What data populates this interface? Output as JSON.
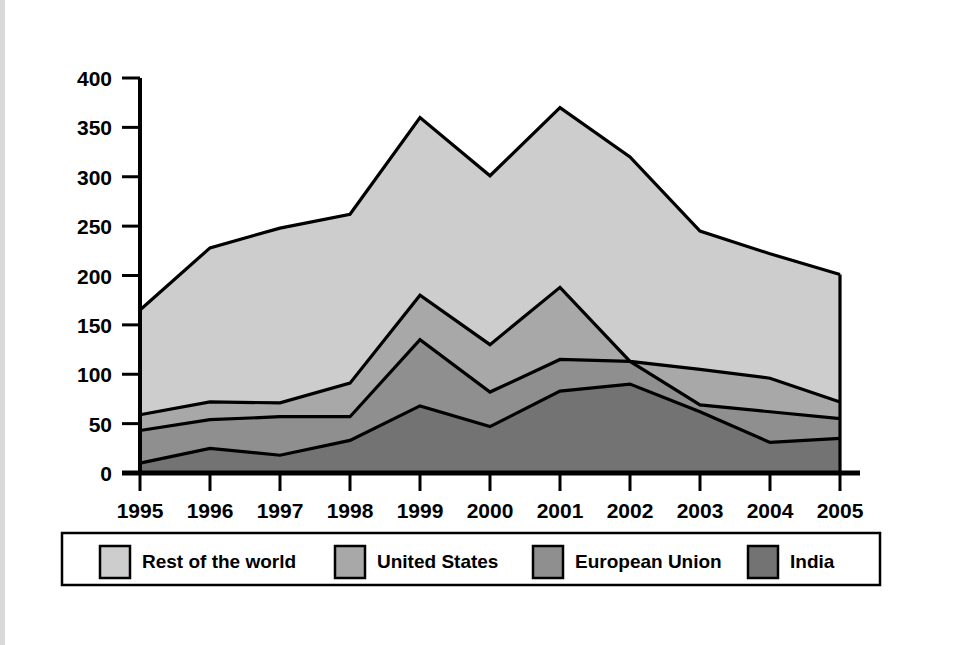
{
  "chart_data": {
    "type": "area",
    "stacked": true,
    "title": "",
    "subtitle": "",
    "xlabel": "",
    "ylabel": "",
    "categories": [
      "1995",
      "1996",
      "1997",
      "1998",
      "1999",
      "2000",
      "2001",
      "2002",
      "2003",
      "2004",
      "2005"
    ],
    "x": [
      1995,
      1996,
      1997,
      1998,
      1999,
      2000,
      2001,
      2002,
      2003,
      2004,
      2005
    ],
    "xtick_labels": [
      "1995",
      "1996",
      "1997",
      "1998",
      "1999",
      "2000",
      "2001",
      "2002",
      "2003",
      "2004",
      "2005"
    ],
    "ytick_labels": [
      "0",
      "50",
      "100",
      "150",
      "200",
      "250",
      "300",
      "350",
      "400"
    ],
    "yticks": [
      0,
      50,
      100,
      150,
      200,
      250,
      300,
      350,
      400
    ],
    "ylim": [
      0,
      400
    ],
    "xlim": [
      1995,
      2005
    ],
    "grid": false,
    "legend_position": "bottom",
    "stack_order_bottom_to_top": [
      "India",
      "European Union",
      "United States",
      "Rest of the world"
    ],
    "series": [
      {
        "name": "India",
        "color": "#737373",
        "values": [
          10,
          25,
          18,
          33,
          68,
          47,
          83,
          90,
          62,
          31,
          35
        ]
      },
      {
        "name": "European Union",
        "color": "#8f8f8f",
        "values": [
          33,
          29,
          39,
          24,
          67,
          35,
          32,
          23,
          7,
          31,
          20
        ]
      },
      {
        "name": "United States",
        "color": "#a8a8a8",
        "values": [
          16,
          18,
          14,
          34,
          45,
          48,
          73,
          0,
          36,
          34,
          17
        ]
      },
      {
        "name": "Rest of the world",
        "color": "#cdcdcd",
        "values": [
          106,
          156,
          177,
          171,
          180,
          171,
          182,
          207,
          140,
          126,
          129
        ]
      }
    ],
    "cumulative_tops": [
      {
        "name": "India",
        "values": [
          10,
          25,
          18,
          33,
          68,
          47,
          83,
          90,
          62,
          31,
          35
        ]
      },
      {
        "name": "European Union",
        "values": [
          43,
          54,
          57,
          57,
          135,
          82,
          115,
          113,
          69,
          62,
          55
        ]
      },
      {
        "name": "United States",
        "values": [
          59,
          72,
          71,
          91,
          180,
          130,
          188,
          113,
          105,
          96,
          72
        ]
      },
      {
        "name": "Rest of the world",
        "values": [
          165,
          228,
          248,
          262,
          360,
          301,
          370,
          320,
          245,
          222,
          201
        ]
      }
    ],
    "legend_entries": [
      {
        "label": "Rest of the world",
        "color": "#cdcdcd"
      },
      {
        "label": "United States",
        "color": "#a8a8a8"
      },
      {
        "label": "European Union",
        "color": "#8f8f8f"
      },
      {
        "label": "India",
        "color": "#737373"
      }
    ]
  },
  "axes": {
    "y_tick_labels": [
      "400",
      "350",
      "300",
      "250",
      "200",
      "150",
      "100",
      "50",
      "0"
    ],
    "x_tick_labels": [
      "1995",
      "1996",
      "1997",
      "1998",
      "1999",
      "2000",
      "2001",
      "2002",
      "2003",
      "2004",
      "2005"
    ]
  },
  "legend": {
    "item_0_label": "Rest of the world",
    "item_1_label": "United States",
    "item_2_label": "European Union",
    "item_3_label": "India"
  },
  "colors": {
    "rest_of_world": "#cdcdcd",
    "united_states": "#a8a8a8",
    "european_union": "#8f8f8f",
    "india": "#737373",
    "axis": "#000000",
    "background": "#ffffff"
  }
}
